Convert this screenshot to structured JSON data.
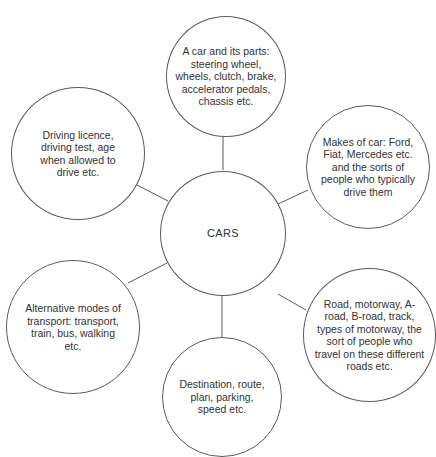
{
  "diagram": {
    "type": "mind-map",
    "line_color": "#5a5a5a",
    "text_color": "#333333",
    "center": {
      "label": "CARS"
    },
    "nodes": [
      {
        "id": "car-parts",
        "label": "A car and its parts: steering wheel, wheels, clutch, brake, accelerator pedals, chassis etc."
      },
      {
        "id": "makes",
        "label": "Makes of car: Ford, Fiat, Mercedes etc. and the sorts of people who typically drive them"
      },
      {
        "id": "roads",
        "label": "Road, motorway, A-road, B-road, track, types of motorway, the sort of people who travel on these different roads etc."
      },
      {
        "id": "destination",
        "label": "Destination, route, plan, parking, speed etc."
      },
      {
        "id": "alternative",
        "label": "Alternative modes of transport: transport, train, bus, walking etc."
      },
      {
        "id": "licence",
        "label": "Driving licence, driving test, age when allowed to drive etc."
      }
    ]
  }
}
